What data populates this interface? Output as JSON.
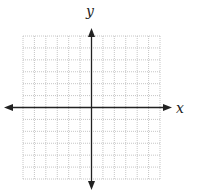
{
  "diagram": {
    "type": "coordinate-plane",
    "axes": {
      "x_label": "x",
      "y_label": "y",
      "arrows": "both-ends",
      "color": "#222222"
    },
    "grid": {
      "columns": 12,
      "rows": 12,
      "columns_left_of_y_axis": 6,
      "columns_right_of_y_axis": 6,
      "rows_above_x_axis": 6,
      "rows_below_x_axis": 6,
      "line_style": "dotted",
      "color": "#b8b8b8"
    },
    "tick_labels": []
  }
}
